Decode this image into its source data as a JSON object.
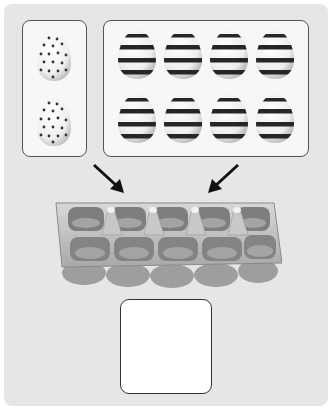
{
  "task": {
    "type": "counting-addition",
    "group_a": {
      "label": "dotted eggs",
      "count": 2,
      "pattern": "dots"
    },
    "group_b": {
      "label": "striped eggs",
      "count": 8,
      "pattern": "stripes",
      "rows": 2,
      "cols": 4
    },
    "container": {
      "label": "egg carton",
      "slots": 10
    },
    "answer_box": {
      "value": ""
    }
  },
  "colors": {
    "background": "#e6e6e6",
    "box_fill": "#f7f7f7",
    "border": "#555555",
    "stripe": "#2a2a2a",
    "tray": "#b8b8b8"
  }
}
